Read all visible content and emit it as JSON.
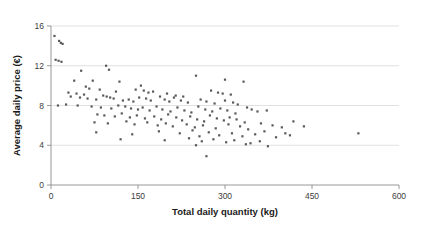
{
  "chart_data": {
    "type": "scatter",
    "title": "",
    "xlabel": "Total daily quantity (kg)",
    "ylabel": "Average daily price (€)",
    "xlim": [
      0,
      600
    ],
    "ylim": [
      0,
      16
    ],
    "xticks": [
      0,
      150,
      300,
      450,
      600
    ],
    "xtick_labels": [
      "0",
      "150",
      "300",
      "450",
      "600"
    ],
    "yticks": [
      0,
      4,
      8,
      12,
      16
    ],
    "ytick_labels": [
      "0",
      "4",
      "8",
      "12",
      "16"
    ],
    "grid": "horizontal",
    "legend": "none",
    "marker_color": "#595959",
    "marker_shape": "square",
    "gridline_color": "#d9d9d9",
    "axis_color": "#8c8c8c",
    "series": [
      {
        "name": "daily observations",
        "points": [
          [
            6,
            15.0
          ],
          [
            14,
            14.5
          ],
          [
            17,
            14.3
          ],
          [
            20,
            14.2
          ],
          [
            8,
            12.6
          ],
          [
            13,
            12.5
          ],
          [
            18,
            12.4
          ],
          [
            52,
            11.5
          ],
          [
            95,
            12.0
          ],
          [
            100,
            11.6
          ],
          [
            40,
            10.5
          ],
          [
            72,
            10.5
          ],
          [
            118,
            10.4
          ],
          [
            155,
            10.0
          ],
          [
            250,
            11.0
          ],
          [
            300,
            10.6
          ],
          [
            332,
            10.4
          ],
          [
            60,
            9.9
          ],
          [
            66,
            9.7
          ],
          [
            84,
            9.6
          ],
          [
            112,
            9.4
          ],
          [
            30,
            9.3
          ],
          [
            44,
            9.2
          ],
          [
            57,
            9.1
          ],
          [
            146,
            9.6
          ],
          [
            160,
            9.5
          ],
          [
            168,
            9.3
          ],
          [
            176,
            9.4
          ],
          [
            200,
            9.2
          ],
          [
            215,
            9.0
          ],
          [
            228,
            8.9
          ],
          [
            276,
            9.5
          ],
          [
            288,
            9.3
          ],
          [
            296,
            9.2
          ],
          [
            310,
            9.1
          ],
          [
            34,
            8.9
          ],
          [
            50,
            8.8
          ],
          [
            63,
            8.7
          ],
          [
            78,
            8.6
          ],
          [
            90,
            9.0
          ],
          [
            96,
            8.9
          ],
          [
            102,
            8.8
          ],
          [
            108,
            8.7
          ],
          [
            124,
            8.5
          ],
          [
            134,
            8.6
          ],
          [
            142,
            8.4
          ],
          [
            152,
            8.8
          ],
          [
            164,
            8.7
          ],
          [
            172,
            8.5
          ],
          [
            188,
            8.9
          ],
          [
            196,
            8.6
          ],
          [
            204,
            8.4
          ],
          [
            212,
            8.8
          ],
          [
            224,
            8.5
          ],
          [
            236,
            8.3
          ],
          [
            258,
            8.6
          ],
          [
            268,
            8.4
          ],
          [
            282,
            8.2
          ],
          [
            300,
            8.5
          ],
          [
            314,
            8.3
          ],
          [
            322,
            8.1
          ],
          [
            12,
            8.0
          ],
          [
            26,
            8.1
          ],
          [
            46,
            8.0
          ],
          [
            70,
            7.9
          ],
          [
            86,
            7.8
          ],
          [
            104,
            7.7
          ],
          [
            116,
            8.0
          ],
          [
            128,
            7.9
          ],
          [
            138,
            7.7
          ],
          [
            150,
            7.6
          ],
          [
            158,
            7.8
          ],
          [
            170,
            7.5
          ],
          [
            182,
            7.9
          ],
          [
            192,
            7.6
          ],
          [
            206,
            7.4
          ],
          [
            218,
            7.8
          ],
          [
            230,
            7.5
          ],
          [
            242,
            7.3
          ],
          [
            254,
            7.9
          ],
          [
            266,
            7.6
          ],
          [
            278,
            7.4
          ],
          [
            292,
            7.7
          ],
          [
            304,
            7.5
          ],
          [
            318,
            7.2
          ],
          [
            338,
            7.8
          ],
          [
            346,
            7.6
          ],
          [
            356,
            7.4
          ],
          [
            372,
            7.5
          ],
          [
            80,
            7.1
          ],
          [
            92,
            7.0
          ],
          [
            110,
            6.9
          ],
          [
            122,
            7.2
          ],
          [
            136,
            6.8
          ],
          [
            148,
            7.0
          ],
          [
            162,
            6.7
          ],
          [
            178,
            6.9
          ],
          [
            190,
            6.6
          ],
          [
            202,
            7.1
          ],
          [
            216,
            6.8
          ],
          [
            226,
            6.5
          ],
          [
            240,
            6.9
          ],
          [
            252,
            6.6
          ],
          [
            264,
            6.4
          ],
          [
            274,
            7.0
          ],
          [
            286,
            6.7
          ],
          [
            298,
            6.5
          ],
          [
            308,
            6.8
          ],
          [
            320,
            6.6
          ],
          [
            334,
            6.3
          ],
          [
            75,
            6.3
          ],
          [
            98,
            6.2
          ],
          [
            130,
            6.4
          ],
          [
            144,
            6.1
          ],
          [
            166,
            6.3
          ],
          [
            184,
            6.0
          ],
          [
            198,
            6.2
          ],
          [
            210,
            5.9
          ],
          [
            234,
            6.1
          ],
          [
            248,
            5.8
          ],
          [
            262,
            6.0
          ],
          [
            284,
            5.7
          ],
          [
            306,
            6.1
          ],
          [
            326,
            5.9
          ],
          [
            340,
            5.6
          ],
          [
            362,
            6.2
          ],
          [
            382,
            6.0
          ],
          [
            398,
            5.8
          ],
          [
            418,
            6.4
          ],
          [
            436,
            5.9
          ],
          [
            78,
            5.3
          ],
          [
            140,
            5.1
          ],
          [
            186,
            5.4
          ],
          [
            222,
            5.2
          ],
          [
            244,
            5.5
          ],
          [
            256,
            4.9
          ],
          [
            272,
            5.3
          ],
          [
            290,
            5.0
          ],
          [
            312,
            5.2
          ],
          [
            330,
            4.9
          ],
          [
            352,
            5.1
          ],
          [
            368,
            5.4
          ],
          [
            388,
            4.8
          ],
          [
            404,
            5.2
          ],
          [
            412,
            5.0
          ],
          [
            120,
            4.6
          ],
          [
            196,
            4.5
          ],
          [
            238,
            4.7
          ],
          [
            260,
            4.4
          ],
          [
            280,
            4.6
          ],
          [
            302,
            4.3
          ],
          [
            316,
            4.5
          ],
          [
            344,
            4.2
          ],
          [
            360,
            4.4
          ],
          [
            250,
            4.0
          ],
          [
            336,
            4.1
          ],
          [
            374,
            3.9
          ],
          [
            268,
            2.9
          ],
          [
            530,
            5.2
          ]
        ]
      }
    ]
  },
  "plot_geometry": {
    "left": 51,
    "right": 399,
    "top": 26,
    "bottom": 185
  }
}
